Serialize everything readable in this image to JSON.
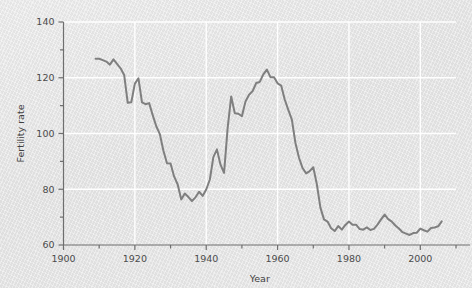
{
  "chart_data": {
    "type": "line",
    "title": "",
    "subtitle": "",
    "xlabel": "Year",
    "ylabel": "Fertility rate",
    "xlim": [
      1900,
      2010
    ],
    "ylim": [
      60,
      140
    ],
    "grid": true,
    "legend": null,
    "legend_position": "none",
    "x_major_ticks": [
      1900,
      1920,
      1940,
      1960,
      1980,
      2000
    ],
    "x_major_tick_labels": [
      "1900",
      "1920",
      "1940",
      "1960",
      "1980",
      "2000"
    ],
    "x_minor_ticks": [
      1910,
      1930,
      1950,
      1970,
      1990,
      2010
    ],
    "y_major_ticks": [
      60,
      80,
      100,
      120,
      140
    ],
    "y_major_tick_labels": [
      "60",
      "80",
      "100",
      "120",
      "140"
    ],
    "y_minor_ticks": [
      70,
      90,
      110,
      130
    ],
    "line_color": "#7f7f7f",
    "line_width": 2.0,
    "series": [
      {
        "name": "Fertility rate",
        "x": [
          1909,
          1910,
          1911,
          1912,
          1913,
          1914,
          1915,
          1916,
          1917,
          1918,
          1919,
          1920,
          1921,
          1922,
          1923,
          1924,
          1925,
          1926,
          1927,
          1928,
          1929,
          1930,
          1931,
          1932,
          1933,
          1934,
          1935,
          1936,
          1937,
          1938,
          1939,
          1940,
          1941,
          1942,
          1943,
          1944,
          1945,
          1946,
          1947,
          1948,
          1949,
          1950,
          1951,
          1952,
          1953,
          1954,
          1955,
          1956,
          1957,
          1958,
          1959,
          1960,
          1961,
          1962,
          1963,
          1964,
          1965,
          1966,
          1967,
          1968,
          1969,
          1970,
          1971,
          1972,
          1973,
          1974,
          1975,
          1976,
          1977,
          1978,
          1979,
          1980,
          1981,
          1982,
          1983,
          1984,
          1985,
          1986,
          1987,
          1988,
          1989,
          1990,
          1991,
          1992,
          1993,
          1994,
          1995,
          1996,
          1997,
          1998,
          1999,
          2000,
          2001,
          2002,
          2003,
          2004,
          2005,
          2006
        ],
        "y": [
          126.8,
          126.8,
          126.3,
          125.8,
          124.7,
          126.6,
          125.0,
          123.4,
          121.0,
          111.0,
          111.2,
          117.9,
          119.8,
          111.2,
          110.5,
          110.9,
          106.6,
          102.6,
          99.8,
          93.8,
          89.3,
          89.2,
          84.6,
          81.7,
          76.3,
          78.5,
          77.2,
          75.8,
          77.1,
          79.1,
          77.6,
          79.9,
          83.4,
          91.5,
          94.3,
          88.8,
          85.9,
          101.9,
          113.3,
          107.3,
          107.1,
          106.2,
          111.5,
          113.9,
          115.2,
          118.1,
          118.5,
          121.2,
          122.9,
          120.2,
          120.2,
          118.0,
          117.2,
          112.2,
          108.5,
          105.0,
          96.6,
          91.3,
          87.6,
          85.7,
          86.5,
          87.9,
          81.8,
          73.4,
          69.2,
          68.4,
          66.0,
          65.0,
          66.8,
          65.5,
          67.2,
          68.4,
          67.3,
          67.3,
          65.7,
          65.5,
          66.3,
          65.4,
          65.8,
          67.3,
          69.2,
          70.9,
          69.3,
          68.4,
          67.0,
          65.9,
          64.6,
          64.1,
          63.6,
          64.3,
          64.4,
          65.9,
          65.3,
          64.8,
          66.1,
          66.3,
          66.7,
          68.5
        ]
      }
    ]
  }
}
